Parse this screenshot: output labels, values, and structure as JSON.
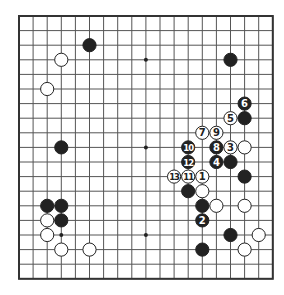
{
  "board": {
    "size": 19,
    "origin_x": 19,
    "origin_y": 16,
    "step_x": 14.1,
    "step_y": 14.6,
    "line_color": "#555555",
    "border_color": "#333333",
    "hoshi": [
      [
        3,
        3
      ],
      [
        9,
        3
      ],
      [
        15,
        3
      ],
      [
        3,
        9
      ],
      [
        9,
        9
      ],
      [
        15,
        9
      ],
      [
        3,
        15
      ],
      [
        9,
        15
      ],
      [
        15,
        15
      ]
    ]
  },
  "colors": {
    "black_stone": "#222222",
    "white_stone": "#ffffff",
    "white_outline": "#222222"
  },
  "stones": [
    {
      "color": "black",
      "col": 5,
      "row": 2
    },
    {
      "color": "white",
      "col": 3,
      "row": 3
    },
    {
      "color": "black",
      "col": 15,
      "row": 3
    },
    {
      "color": "white",
      "col": 2,
      "row": 5
    },
    {
      "color": "black",
      "col": 16,
      "row": 6,
      "label": "6"
    },
    {
      "color": "white",
      "col": 15,
      "row": 7,
      "label": "5"
    },
    {
      "color": "black",
      "col": 16,
      "row": 7
    },
    {
      "color": "white",
      "col": 13,
      "row": 8,
      "label": "7"
    },
    {
      "color": "white",
      "col": 14,
      "row": 8,
      "label": "9"
    },
    {
      "color": "black",
      "col": 3,
      "row": 9
    },
    {
      "color": "black",
      "col": 12,
      "row": 9,
      "label": "10"
    },
    {
      "color": "black",
      "col": 14,
      "row": 9,
      "label": "8"
    },
    {
      "color": "white",
      "col": 15,
      "row": 9,
      "label": "3"
    },
    {
      "color": "white",
      "col": 16,
      "row": 9
    },
    {
      "color": "black",
      "col": 12,
      "row": 10,
      "label": "12"
    },
    {
      "color": "black",
      "col": 14,
      "row": 10,
      "label": "4"
    },
    {
      "color": "black",
      "col": 15,
      "row": 10
    },
    {
      "color": "white",
      "col": 11,
      "row": 11,
      "label": "13"
    },
    {
      "color": "white",
      "col": 12,
      "row": 11,
      "label": "11"
    },
    {
      "color": "white",
      "col": 13,
      "row": 11,
      "label": "1"
    },
    {
      "color": "black",
      "col": 16,
      "row": 11
    },
    {
      "color": "black",
      "col": 12,
      "row": 12
    },
    {
      "color": "white",
      "col": 13,
      "row": 12
    },
    {
      "color": "black",
      "col": 2,
      "row": 13
    },
    {
      "color": "black",
      "col": 3,
      "row": 13
    },
    {
      "color": "black",
      "col": 13,
      "row": 13
    },
    {
      "color": "white",
      "col": 14,
      "row": 13
    },
    {
      "color": "white",
      "col": 16,
      "row": 13
    },
    {
      "color": "white",
      "col": 2,
      "row": 14
    },
    {
      "color": "black",
      "col": 3,
      "row": 14
    },
    {
      "color": "black",
      "col": 13,
      "row": 14,
      "label": "2"
    },
    {
      "color": "white",
      "col": 2,
      "row": 15
    },
    {
      "color": "black",
      "col": 15,
      "row": 15
    },
    {
      "color": "white",
      "col": 17,
      "row": 15
    },
    {
      "color": "white",
      "col": 3,
      "row": 16
    },
    {
      "color": "white",
      "col": 5,
      "row": 16
    },
    {
      "color": "black",
      "col": 13,
      "row": 16
    },
    {
      "color": "white",
      "col": 16,
      "row": 16
    }
  ]
}
